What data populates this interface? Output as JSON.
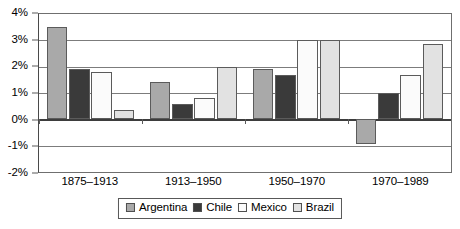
{
  "chart_data": {
    "type": "bar",
    "title": "",
    "subtitle": "",
    "xlabel": "",
    "ylabel": "",
    "categories": [
      "1875–1913",
      "1913–1950",
      "1950–1970",
      "1970–1989"
    ],
    "series": [
      {
        "name": "Argentina",
        "color": "#a9a9a9",
        "values": [
          3.5,
          1.4,
          1.9,
          -0.95
        ]
      },
      {
        "name": "Chile",
        "color": "#3a3a3a",
        "values": [
          1.9,
          0.6,
          1.7,
          1.0
        ]
      },
      {
        "name": "Mexico",
        "color": "#fbfbfb",
        "values": [
          1.8,
          0.8,
          3.0,
          1.7
        ]
      },
      {
        "name": "Brazil",
        "color": "#e2e2e2",
        "values": [
          0.35,
          2.0,
          3.0,
          2.85
        ]
      }
    ],
    "ylim": [
      -2,
      4
    ],
    "ytick_values": [
      4,
      3,
      2,
      1,
      0,
      -1,
      -2
    ],
    "ytick_labels": [
      "4%",
      "3%",
      "2%",
      "1%",
      "0%",
      "-1%",
      "-2%"
    ],
    "grid": true,
    "grid_axis": "y",
    "legend_position": "bottom",
    "legend_entries": [
      "Argentina",
      "Chile",
      "Mexico",
      "Brazil"
    ],
    "zero_line": 0,
    "value_unit": "%"
  },
  "axes": {
    "frame_color": "#6f6f6f",
    "grid_color": "#7c7c7c",
    "zero_line_color": "#3d3d3d"
  }
}
